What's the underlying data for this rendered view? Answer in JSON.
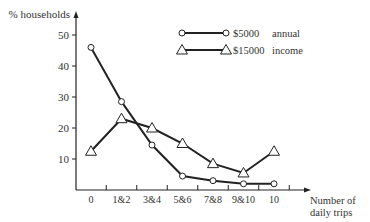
{
  "chart_data": {
    "type": "line",
    "title": "",
    "ylabel": "% households",
    "xlabel": "Number of daily trips",
    "xlabel_lines": [
      "Number of",
      "daily trips"
    ],
    "categories": [
      "0",
      "1&2",
      "3&4",
      "5&6",
      "7&8",
      "9&10",
      "10"
    ],
    "yticks": [
      10,
      20,
      30,
      40,
      50
    ],
    "ylim": [
      0,
      55
    ],
    "grid": false,
    "legend_position": "upper right",
    "series": [
      {
        "name": "$5000 annual income",
        "legend_label": "$5000",
        "marker": "circle",
        "values": [
          46,
          28.5,
          14.5,
          4.5,
          3,
          2,
          2
        ]
      },
      {
        "name": "$15000 annual income",
        "legend_label": "$15000",
        "marker": "triangle",
        "values": [
          12.5,
          23,
          20,
          15,
          8.5,
          5.5,
          12.5
        ]
      }
    ],
    "legend_suffix": [
      "annual",
      "income"
    ]
  }
}
